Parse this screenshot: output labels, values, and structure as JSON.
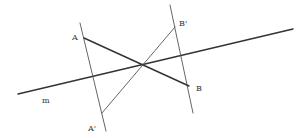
{
  "diagram": {
    "colors": {
      "stroke": "#333333",
      "thin_stroke": "#555555",
      "background": "#ffffff"
    },
    "lines": [
      {
        "id": "m",
        "x1": 18,
        "y1": 94,
        "x2": 293,
        "y2": 29,
        "style": "thick"
      },
      {
        "id": "perp-A",
        "x1": 80,
        "y1": 23,
        "x2": 106,
        "y2": 131,
        "style": "thin"
      },
      {
        "id": "perp-B",
        "x1": 170,
        "y1": 5,
        "x2": 193,
        "y2": 113,
        "style": "thin"
      },
      {
        "id": "AB",
        "x1": 84,
        "y1": 38,
        "x2": 189,
        "y2": 86,
        "style": "thick"
      },
      {
        "id": "A'B'",
        "x1": 102,
        "y1": 113,
        "x2": 175,
        "y2": 27,
        "style": "thin"
      }
    ],
    "labels": {
      "A": {
        "text": "A",
        "x": 72,
        "y": 40
      },
      "B_prime": {
        "text": "B'",
        "x": 179,
        "y": 26
      },
      "B": {
        "text": "B",
        "x": 196,
        "y": 91
      },
      "A_prime": {
        "text": "A'",
        "x": 88,
        "y": 131
      },
      "m": {
        "text": "m",
        "x": 42,
        "y": 103
      }
    }
  }
}
